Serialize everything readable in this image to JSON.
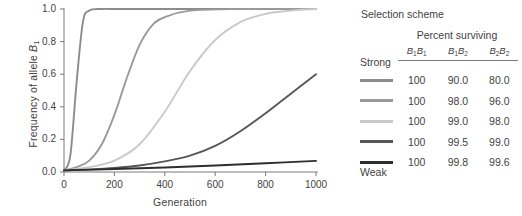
{
  "chart_data": {
    "type": "line",
    "title": "",
    "xlabel": "Generation",
    "ylabel": "Frequency of allele B1",
    "ylabel_html": "Frequency of allele <i>B</i><sub>1</sub>",
    "xlim": [
      0,
      1000
    ],
    "ylim": [
      0.0,
      1.0
    ],
    "grid": false,
    "legend_position": "right",
    "xticks": [
      "0",
      "200",
      "400",
      "600",
      "800",
      "1000"
    ],
    "xtick_values": [
      0,
      200,
      400,
      600,
      800,
      1000
    ],
    "yticks": [
      "0.0",
      "0.2",
      "0.4",
      "0.6",
      "0.8",
      "1.0"
    ],
    "ytick_values": [
      0.0,
      0.2,
      0.4,
      0.6,
      0.8,
      1.0
    ],
    "initial_frequency": 0.01,
    "series": [
      {
        "name": "Strong selection (100 / 90.0 / 80.0)",
        "color": "#8c8c8c",
        "fitness": [
          1.0,
          0.9,
          0.8
        ],
        "x": [
          0,
          25,
          50,
          75,
          100,
          150,
          200,
          300,
          400,
          600,
          800,
          1000
        ],
        "values": [
          0.01,
          0.1,
          0.55,
          0.92,
          0.99,
          1.0,
          1.0,
          1.0,
          1.0,
          1.0,
          1.0,
          1.0
        ]
      },
      {
        "name": "(100 / 98.0 / 96.0)",
        "color": "#9a9a9a",
        "fitness": [
          1.0,
          0.98,
          0.96
        ],
        "x": [
          0,
          50,
          100,
          150,
          200,
          250,
          300,
          350,
          400,
          500,
          700,
          1000
        ],
        "values": [
          0.01,
          0.03,
          0.07,
          0.17,
          0.35,
          0.58,
          0.78,
          0.9,
          0.95,
          0.99,
          1.0,
          1.0
        ]
      },
      {
        "name": "(100 / 99.0 / 98.0)",
        "color": "#c9c9c9",
        "fitness": [
          1.0,
          0.99,
          0.98
        ],
        "x": [
          0,
          100,
          200,
          300,
          400,
          500,
          600,
          700,
          800,
          900,
          1000
        ],
        "values": [
          0.01,
          0.03,
          0.07,
          0.17,
          0.37,
          0.62,
          0.81,
          0.92,
          0.97,
          0.99,
          1.0
        ]
      },
      {
        "name": "(100 / 99.5 / 99.0)",
        "color": "#575757",
        "fitness": [
          1.0,
          0.995,
          0.99
        ],
        "x": [
          0,
          100,
          200,
          300,
          400,
          500,
          600,
          700,
          800,
          900,
          1000
        ],
        "values": [
          0.01,
          0.016,
          0.025,
          0.04,
          0.065,
          0.1,
          0.16,
          0.25,
          0.36,
          0.48,
          0.6
        ]
      },
      {
        "name": "Weak selection (100 / 99.8 / 99.6)",
        "color": "#2e2e2e",
        "fitness": [
          1.0,
          0.998,
          0.996
        ],
        "x": [
          0,
          200,
          400,
          600,
          800,
          1000
        ],
        "values": [
          0.01,
          0.018,
          0.028,
          0.04,
          0.054,
          0.068
        ]
      }
    ]
  },
  "legend": {
    "title": "Selection scheme",
    "percent_surviving_title": "Percent surviving",
    "columns": [
      "B1B1",
      "B1B2",
      "B2B2"
    ],
    "strong_label": "Strong",
    "weak_label": "Weak",
    "rows": [
      {
        "color": "#8c8c8c",
        "values": [
          "100",
          "90.0",
          "80.0"
        ]
      },
      {
        "color": "#9a9a9a",
        "values": [
          "100",
          "98.0",
          "96.0"
        ]
      },
      {
        "color": "#c9c9c9",
        "values": [
          "100",
          "99.0",
          "98.0"
        ]
      },
      {
        "color": "#575757",
        "values": [
          "100",
          "99.5",
          "99.0"
        ]
      },
      {
        "color": "#2e2e2e",
        "values": [
          "100",
          "99.8",
          "99.6"
        ]
      }
    ]
  },
  "axis_color": "#7a7a7a"
}
